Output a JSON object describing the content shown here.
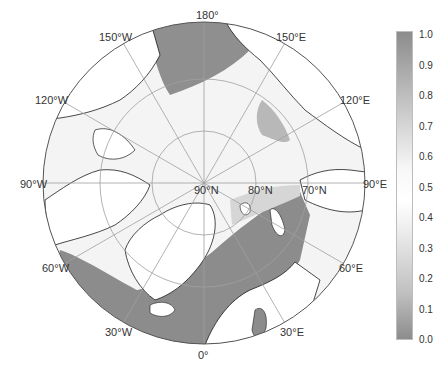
{
  "figure": {
    "type": "polar-stereographic-map",
    "region": "Arctic",
    "colors": {
      "ocean_low": "#8c8c8c",
      "ice_high": "#fafafa",
      "land": "#ffffff",
      "coastline": "#1a1a1a",
      "graticule": "#a0a0a0"
    }
  },
  "longitude_labels": [
    {
      "text": "180°",
      "x": 196,
      "y": 10
    },
    {
      "text": "150°E",
      "x": 276,
      "y": 32
    },
    {
      "text": "120°E",
      "x": 340,
      "y": 95
    },
    {
      "text": "90°E",
      "x": 363,
      "y": 179
    },
    {
      "text": "60°E",
      "x": 339,
      "y": 263
    },
    {
      "text": "30°E",
      "x": 280,
      "y": 327
    },
    {
      "text": "0°",
      "x": 198,
      "y": 350
    },
    {
      "text": "30°W",
      "x": 105,
      "y": 327
    },
    {
      "text": "60°W",
      "x": 42,
      "y": 263
    },
    {
      "text": "90°W",
      "x": 20,
      "y": 179
    },
    {
      "text": "120°W",
      "x": 35,
      "y": 95
    },
    {
      "text": "150°W",
      "x": 99,
      "y": 32
    }
  ],
  "latitude_labels": [
    {
      "text": "90°N",
      "x": 194,
      "y": 185
    },
    {
      "text": "80°N",
      "x": 248,
      "y": 185
    },
    {
      "text": "70°N",
      "x": 302,
      "y": 185
    }
  ],
  "colorbar": {
    "min": 0.0,
    "max": 1.0,
    "ticks": [
      "1.0",
      "0.9",
      "0.8",
      "0.7",
      "0.6",
      "0.5",
      "0.4",
      "0.3",
      "0.2",
      "0.1",
      "0.0"
    ]
  }
}
